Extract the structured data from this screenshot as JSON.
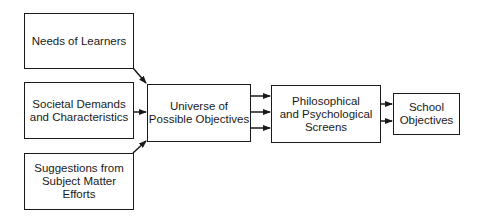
{
  "diagram": {
    "type": "flowchart",
    "direction": "left-to-right",
    "nodes": [
      {
        "id": "needs",
        "label": "Needs of Learners"
      },
      {
        "id": "societal",
        "label": "Societal Demands\nand Characteristics"
      },
      {
        "id": "suggestions",
        "label": "Suggestions from\nSubject Matter\nEfforts"
      },
      {
        "id": "universe",
        "label": "Universe of\nPossible Objectives"
      },
      {
        "id": "screens",
        "label": "Philosophical\nand Psychological\nScreens"
      },
      {
        "id": "school",
        "label": "School\nObjectives"
      }
    ],
    "edges": [
      {
        "from": "needs",
        "to": "universe"
      },
      {
        "from": "societal",
        "to": "universe"
      },
      {
        "from": "suggestions",
        "to": "universe"
      },
      {
        "from": "universe",
        "to": "screens",
        "count": 3
      },
      {
        "from": "screens",
        "to": "school",
        "count": 2
      }
    ],
    "colors": {
      "line": "#1a1a1a",
      "background": "#ffffff"
    }
  }
}
